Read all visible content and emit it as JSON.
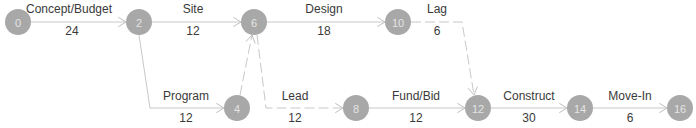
{
  "diagram": {
    "type": "activity-network",
    "colors": {
      "node_fill": "#a8a8a8",
      "node_text": "#e4e4e4",
      "edge": "#c8c8c8",
      "label": "#3a3a3a"
    },
    "node_radius": 13,
    "nodes": [
      {
        "id": "0",
        "label": "0",
        "x": 18,
        "y": 22
      },
      {
        "id": "2",
        "label": "2",
        "x": 139,
        "y": 22
      },
      {
        "id": "6",
        "label": "6",
        "x": 254,
        "y": 22
      },
      {
        "id": "10",
        "label": "10",
        "x": 398,
        "y": 22
      },
      {
        "id": "4",
        "label": "4",
        "x": 237,
        "y": 108
      },
      {
        "id": "8",
        "label": "8",
        "x": 356,
        "y": 108
      },
      {
        "id": "12",
        "label": "12",
        "x": 478,
        "y": 108
      },
      {
        "id": "14",
        "label": "14",
        "x": 580,
        "y": 108
      },
      {
        "id": "16",
        "label": "16",
        "x": 680,
        "y": 108
      }
    ],
    "edges": [
      {
        "from": "0",
        "to": "2",
        "name": "Concept/Budget",
        "duration": "24",
        "style": "solid",
        "points": [
          [
            31,
            22
          ],
          [
            126,
            22
          ]
        ],
        "name_pos": [
          69,
          13
        ],
        "dur_pos": [
          72,
          35
        ]
      },
      {
        "from": "2",
        "to": "6",
        "name": "Site",
        "duration": "12",
        "style": "solid",
        "points": [
          [
            152,
            22
          ],
          [
            241,
            22
          ]
        ],
        "name_pos": [
          193,
          13
        ],
        "dur_pos": [
          193,
          35
        ]
      },
      {
        "from": "6",
        "to": "10",
        "name": "Design",
        "duration": "18",
        "style": "solid",
        "points": [
          [
            267,
            22
          ],
          [
            385,
            22
          ]
        ],
        "name_pos": [
          324,
          13
        ],
        "dur_pos": [
          324,
          35
        ]
      },
      {
        "from": "10",
        "to": "12",
        "name": "Lag",
        "duration": "6",
        "style": "dashed",
        "points": [
          [
            411,
            22
          ],
          [
            462,
            22
          ],
          [
            474,
            95
          ]
        ],
        "name_pos": [
          437,
          13
        ],
        "dur_pos": [
          437,
          35
        ]
      },
      {
        "from": "2",
        "to": "4",
        "name": "Program",
        "duration": "12",
        "style": "solid",
        "points": [
          [
            139,
            35
          ],
          [
            150,
            108
          ],
          [
            224,
            108
          ]
        ],
        "name_pos": [
          186,
          100
        ],
        "dur_pos": [
          186,
          122
        ]
      },
      {
        "from": "4",
        "to": "6",
        "name": "",
        "duration": "",
        "style": "dashed",
        "points": [
          [
            240,
            95
          ],
          [
            252,
            35
          ]
        ],
        "name_pos": null,
        "dur_pos": null
      },
      {
        "from": "6",
        "to": "8",
        "name": "Lead",
        "duration": "12",
        "style": "dashed",
        "points": [
          [
            257,
            35
          ],
          [
            266,
            108
          ],
          [
            343,
            108
          ]
        ],
        "name_pos": [
          295,
          100
        ],
        "dur_pos": [
          295,
          122
        ]
      },
      {
        "from": "8",
        "to": "12",
        "name": "Fund/Bid",
        "duration": "12",
        "style": "solid",
        "points": [
          [
            369,
            108
          ],
          [
            465,
            108
          ]
        ],
        "name_pos": [
          416,
          100
        ],
        "dur_pos": [
          416,
          122
        ]
      },
      {
        "from": "12",
        "to": "14",
        "name": "Construct",
        "duration": "30",
        "style": "solid",
        "points": [
          [
            491,
            108
          ],
          [
            567,
            108
          ]
        ],
        "name_pos": [
          529,
          100
        ],
        "dur_pos": [
          529,
          122
        ]
      },
      {
        "from": "14",
        "to": "16",
        "name": "Move-In",
        "duration": "6",
        "style": "solid",
        "points": [
          [
            593,
            108
          ],
          [
            667,
            108
          ]
        ],
        "name_pos": [
          630,
          100
        ],
        "dur_pos": [
          630,
          122
        ]
      }
    ]
  }
}
